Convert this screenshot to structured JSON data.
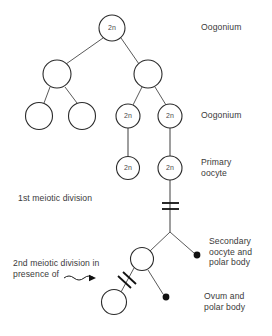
{
  "diagram": {
    "stroke_color": "#2b2b2b",
    "text_color": "#3a3a3a",
    "background": "#ffffff",
    "cells": [
      {
        "id": "oogonium-root",
        "label": "2n",
        "cx": 112,
        "cy": 28,
        "r": 13,
        "filled": false
      },
      {
        "id": "oogonium-left",
        "label": "",
        "cx": 57,
        "cy": 74,
        "r": 14,
        "filled": false
      },
      {
        "id": "oogonium-right",
        "label": "",
        "cx": 148,
        "cy": 74,
        "r": 14,
        "filled": false
      },
      {
        "id": "oogonium-leaf-1",
        "label": "",
        "cx": 39,
        "cy": 116,
        "r": 13.5,
        "filled": false
      },
      {
        "id": "oogonium-leaf-2",
        "label": "",
        "cx": 82,
        "cy": 116,
        "r": 13.5,
        "filled": false
      },
      {
        "id": "oogonium-leaf-3",
        "label": "2n",
        "cx": 128,
        "cy": 116,
        "r": 12,
        "filled": false
      },
      {
        "id": "oogonium-leaf-4",
        "label": "2n",
        "cx": 170,
        "cy": 116,
        "r": 12,
        "filled": false
      },
      {
        "id": "primary-oocyte-left",
        "label": "2n",
        "cx": 128,
        "cy": 168,
        "r": 11.5,
        "filled": false
      },
      {
        "id": "primary-oocyte-right",
        "label": "2n",
        "cx": 170,
        "cy": 168,
        "r": 12,
        "filled": false
      },
      {
        "id": "secondary-oocyte",
        "label": "",
        "cx": 142,
        "cy": 259,
        "r": 11.5,
        "filled": false
      },
      {
        "id": "ovum",
        "label": "",
        "cx": 114,
        "cy": 302,
        "r": 12.5,
        "filled": false
      }
    ],
    "polar_bodies": [
      {
        "id": "polar-body-first",
        "cx": 197,
        "cy": 255,
        "r": 3.4
      },
      {
        "id": "polar-body-second",
        "cx": 166,
        "cy": 297,
        "r": 3.4
      }
    ],
    "labels": [
      {
        "id": "label-oogonium-top",
        "text": "Oogonium",
        "x": 201,
        "y": 22
      },
      {
        "id": "label-oogonium-second",
        "text": "Oogonium",
        "x": 201,
        "y": 110
      },
      {
        "id": "label-primary-oocyte",
        "text": "Primary\noocyte",
        "x": 201,
        "y": 157
      },
      {
        "id": "label-first-meiotic",
        "text": "1st meiotic division",
        "x": 18,
        "y": 193
      },
      {
        "id": "label-secondary-oocyte",
        "text": "Secondary\noocyte and\npolar body",
        "x": 209,
        "y": 236
      },
      {
        "id": "label-second-meiotic",
        "text": "2nd meiotic division in\npresence of",
        "x": 13,
        "y": 258
      },
      {
        "id": "label-ovum",
        "text": "Ovum and\npolar body",
        "x": 204,
        "y": 291
      }
    ],
    "connections": [
      {
        "id": "link-root-to-left",
        "x1": 103,
        "y1": 38,
        "x2": 66,
        "y2": 64
      },
      {
        "id": "link-root-to-right",
        "x1": 121,
        "y1": 38,
        "x2": 139,
        "y2": 64
      },
      {
        "id": "link-left-to-leaf1",
        "x1": 50,
        "y1": 87,
        "x2": 44,
        "y2": 103
      },
      {
        "id": "link-left-to-leaf2",
        "x1": 65,
        "y1": 87,
        "x2": 77,
        "y2": 103
      },
      {
        "id": "link-right-to-leaf3",
        "x1": 142,
        "y1": 87,
        "x2": 133,
        "y2": 105
      },
      {
        "id": "link-right-to-leaf4",
        "x1": 155,
        "y1": 87,
        "x2": 166,
        "y2": 105
      },
      {
        "id": "link-leaf3-to-primary",
        "x1": 128,
        "y1": 128,
        "x2": 128,
        "y2": 157
      },
      {
        "id": "link-leaf4-to-primary",
        "x1": 170,
        "y1": 128,
        "x2": 170,
        "y2": 156
      },
      {
        "id": "stem-primary-to-branch",
        "x1": 170,
        "y1": 180,
        "x2": 170,
        "y2": 232
      },
      {
        "id": "branch-to-secondary",
        "x1": 170,
        "y1": 232,
        "x2": 150,
        "y2": 251
      },
      {
        "id": "branch-to-polar1",
        "x1": 170,
        "y1": 232,
        "x2": 194,
        "y2": 253
      },
      {
        "id": "secondary-to-ovum",
        "x1": 134,
        "y1": 268,
        "x2": 121,
        "y2": 292
      },
      {
        "id": "secondary-to-polar2",
        "x1": 148,
        "y1": 270,
        "x2": 163,
        "y2": 294
      }
    ],
    "hash_marks": {
      "first_division": [
        {
          "id": "hash-first-upper",
          "x1": 162,
          "y1": 203,
          "x2": 179,
          "y2": 203
        },
        {
          "id": "hash-first-lower",
          "x1": 162,
          "y1": 209,
          "x2": 179,
          "y2": 209
        }
      ],
      "second_division": [
        {
          "id": "hash-second-upper",
          "x1": 123,
          "y1": 272,
          "x2": 136,
          "y2": 284
        },
        {
          "id": "hash-second-lower",
          "x1": 118,
          "y1": 276,
          "x2": 131,
          "y2": 288
        }
      ]
    },
    "arrow": {
      "id": "wavy-arrow",
      "path": "M 64 278 q 5 -4 10 0 q 5 4 10 0 q 5 -4 10 0",
      "tip_x": 96,
      "tip_y": 278
    }
  }
}
